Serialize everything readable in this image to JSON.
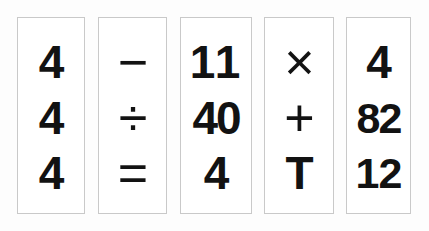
{
  "canvas": {
    "width": 429,
    "height": 231,
    "background_color": "#fdfdfd",
    "card_border_color": "#c9c9c9",
    "card_fill_color": "#ffffff",
    "glyph_color": "#121212"
  },
  "cards": [
    {
      "name": "card-1",
      "cells": [
        {
          "name": "cell-1-1",
          "text": "4"
        },
        {
          "name": "cell-1-2",
          "text": "4"
        },
        {
          "name": "cell-1-3",
          "text": "4"
        }
      ]
    },
    {
      "name": "card-2",
      "cells": [
        {
          "name": "cell-2-1",
          "text": "−"
        },
        {
          "name": "cell-2-2",
          "text": "÷"
        },
        {
          "name": "cell-2-3",
          "text": "="
        }
      ]
    },
    {
      "name": "card-3",
      "cells": [
        {
          "name": "cell-3-1",
          "text": "11"
        },
        {
          "name": "cell-3-2",
          "text": "40"
        },
        {
          "name": "cell-3-3",
          "text": "4"
        }
      ]
    },
    {
      "name": "card-4",
      "cells": [
        {
          "name": "cell-4-1",
          "text": "×"
        },
        {
          "name": "cell-4-2",
          "text": "+"
        },
        {
          "name": "cell-4-3",
          "text": "T"
        }
      ]
    },
    {
      "name": "card-5",
      "cells": [
        {
          "name": "cell-5-1",
          "text": "4"
        },
        {
          "name": "cell-5-2",
          "text": "82"
        },
        {
          "name": "cell-5-3",
          "text": "12"
        }
      ]
    }
  ]
}
